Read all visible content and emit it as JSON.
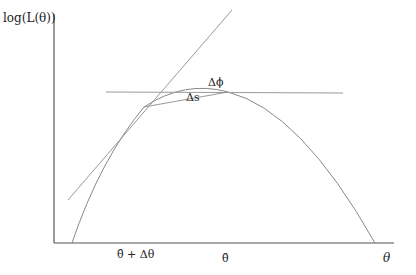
{
  "diagram": {
    "y_axis_label": "log(L(θ))",
    "x_axis_label": "θ",
    "tick_labels": {
      "theta_hat_plus_delta": "θ̂ + Δθ",
      "theta_hat": "θ̂"
    },
    "annotations": {
      "delta_phi": "Δϕ",
      "delta_s": "Δs"
    },
    "colors": {
      "axis": "#555555",
      "curve": "#888888",
      "lines": "#999999",
      "text": "#222222"
    }
  }
}
